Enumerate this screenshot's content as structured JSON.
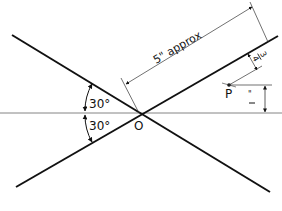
{
  "diagram": {
    "type": "geometric construction",
    "colors": {
      "background": "#ffffff",
      "main_lines": "#111111",
      "thin_lines": "#333333",
      "baseline": "#555555"
    },
    "origin": {
      "label": "O",
      "x": 139,
      "y": 113
    },
    "point_p": {
      "label": "P",
      "x": 230,
      "y": 85
    },
    "angles": [
      {
        "label": "30°",
        "position": "above-baseline"
      },
      {
        "label": "30°",
        "position": "below-baseline"
      }
    ],
    "dimensions": {
      "length_label": "5\" approx",
      "offset_label_num": "3",
      "offset_label_den": "4",
      "height_label": "1",
      "height_label_note": "\""
    }
  }
}
